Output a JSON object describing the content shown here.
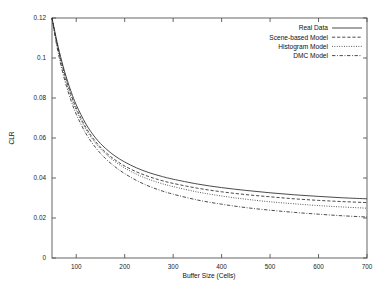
{
  "chart_data": {
    "type": "line",
    "title": "",
    "xlabel": "Buffer Size (Cells)",
    "ylabel": "CLR",
    "xlim": [
      50,
      700
    ],
    "ylim": [
      0,
      0.12
    ],
    "grid": false,
    "legend_position": "top-right",
    "xticks": [
      100,
      200,
      300,
      400,
      500,
      600,
      700
    ],
    "xtick_labels": [
      "100",
      "200",
      "300",
      "400",
      "500",
      "600",
      "700"
    ],
    "yticks": [
      0,
      0.02,
      0.04,
      0.06,
      0.08,
      0.1,
      0.12
    ],
    "ytick_labels": [
      "0",
      "0.02",
      "0.04",
      "0.06",
      "0.08",
      "0.1",
      "0.12"
    ],
    "x": [
      50,
      60,
      70,
      80,
      90,
      100,
      120,
      140,
      160,
      180,
      200,
      225,
      250,
      275,
      300,
      350,
      400,
      450,
      500,
      550,
      600,
      650,
      700
    ],
    "series": [
      {
        "name": "Real Data",
        "dash": "solid",
        "values": [
          0.12,
          0.1085,
          0.0985,
          0.09,
          0.0828,
          0.0766,
          0.067,
          0.06,
          0.0549,
          0.051,
          0.048,
          0.045,
          0.0427,
          0.0409,
          0.0394,
          0.037,
          0.0352,
          0.0338,
          0.0326,
          0.0316,
          0.0308,
          0.0301,
          0.0296
        ]
      },
      {
        "name": "Scene-based Model",
        "dash": "dashed",
        "values": [
          0.12,
          0.1078,
          0.0974,
          0.0886,
          0.0813,
          0.075,
          0.0652,
          0.0582,
          0.053,
          0.0491,
          0.046,
          0.043,
          0.0407,
          0.0388,
          0.0373,
          0.0349,
          0.0331,
          0.0317,
          0.0306,
          0.0296,
          0.0288,
          0.0282,
          0.0277
        ]
      },
      {
        "name": "Histogram Model",
        "dash": "dotted",
        "values": [
          0.12,
          0.107,
          0.0963,
          0.0874,
          0.0801,
          0.0739,
          0.0643,
          0.0574,
          0.0522,
          0.0482,
          0.045,
          0.0418,
          0.0393,
          0.0373,
          0.0357,
          0.033,
          0.031,
          0.0294,
          0.0281,
          0.0271,
          0.0262,
          0.0255,
          0.0249
        ]
      },
      {
        "name": "DMC Model",
        "dash": "dashdot",
        "values": [
          0.12,
          0.106,
          0.0948,
          0.0857,
          0.0782,
          0.0719,
          0.0622,
          0.0552,
          0.0498,
          0.0456,
          0.0422,
          0.0387,
          0.0359,
          0.0337,
          0.0319,
          0.029,
          0.0269,
          0.0252,
          0.0239,
          0.0228,
          0.0219,
          0.0211,
          0.0205
        ]
      }
    ]
  }
}
